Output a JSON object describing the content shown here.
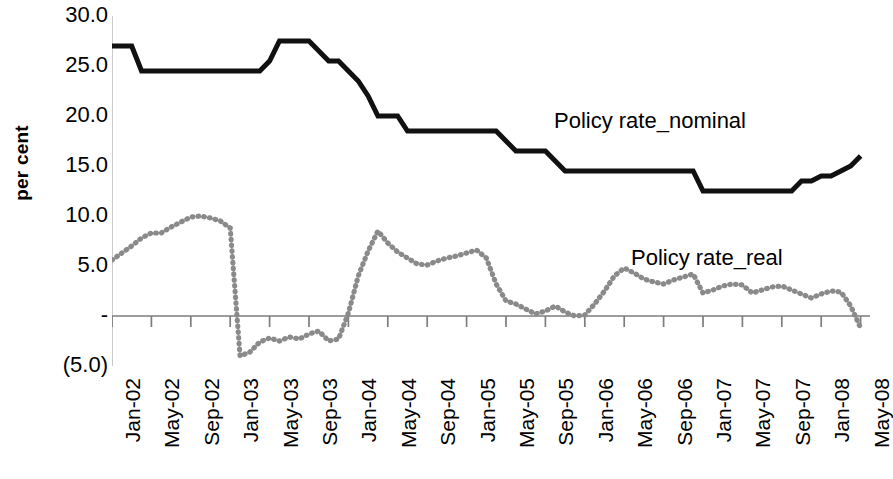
{
  "chart_data": {
    "type": "line",
    "title": "",
    "subtitle": "",
    "xlabel": "",
    "ylabel": "per cent",
    "ylim": [
      -5.0,
      30.0
    ],
    "ytick_values": [
      30.0,
      25.0,
      20.0,
      15.0,
      10.0,
      5.0,
      0.0,
      -5.0
    ],
    "ytick_labels": [
      "30.0",
      "25.0",
      "20.0",
      "15.0",
      "10.0",
      "5.0",
      "-",
      "(5.0)"
    ],
    "grid": false,
    "legend_position": "inline-annotation",
    "x_range": [
      "Jan-02",
      "May-08"
    ],
    "xtick_labels": [
      "Jan-02",
      "May-02",
      "Sep-02",
      "Jan-03",
      "May-03",
      "Sep-03",
      "Jan-04",
      "May-04",
      "Sep-04",
      "Jan-05",
      "May-05",
      "Sep-05",
      "Jan-06",
      "May-06",
      "Sep-06",
      "Jan-07",
      "May-07",
      "Sep-07",
      "Jan-08",
      "May-08"
    ],
    "x_months": [
      "Jan-02",
      "Feb-02",
      "Mar-02",
      "Apr-02",
      "May-02",
      "Jun-02",
      "Jul-02",
      "Aug-02",
      "Sep-02",
      "Oct-02",
      "Nov-02",
      "Dec-02",
      "Jan-03",
      "Feb-03",
      "Mar-03",
      "Apr-03",
      "May-03",
      "Jun-03",
      "Jul-03",
      "Aug-03",
      "Sep-03",
      "Oct-03",
      "Nov-03",
      "Dec-03",
      "Jan-04",
      "Feb-04",
      "Mar-04",
      "Apr-04",
      "May-04",
      "Jun-04",
      "Jul-04",
      "Aug-04",
      "Sep-04",
      "Oct-04",
      "Nov-04",
      "Dec-04",
      "Jan-05",
      "Feb-05",
      "Mar-05",
      "Apr-05",
      "May-05",
      "Jun-05",
      "Jul-05",
      "Aug-05",
      "Sep-05",
      "Oct-05",
      "Nov-05",
      "Dec-05",
      "Jan-06",
      "Feb-06",
      "Mar-06",
      "Apr-06",
      "May-06",
      "Jun-06",
      "Jul-06",
      "Aug-06",
      "Sep-06",
      "Oct-06",
      "Nov-06",
      "Dec-06",
      "Jan-07",
      "Feb-07",
      "Mar-07",
      "Apr-07",
      "May-07",
      "Jun-07",
      "Jul-07",
      "Aug-07",
      "Sep-07",
      "Oct-07",
      "Nov-07",
      "Dec-07",
      "Jan-08",
      "Feb-08",
      "Mar-08",
      "Apr-08",
      "May-08"
    ],
    "series": [
      {
        "name": "Policy rate_nominal",
        "style": "solid-thick-black",
        "color": "#111111",
        "values": [
          27.0,
          27.0,
          27.0,
          24.5,
          24.5,
          24.5,
          24.5,
          24.5,
          24.5,
          24.5,
          24.5,
          24.5,
          24.5,
          24.5,
          24.5,
          24.5,
          25.5,
          27.5,
          27.5,
          27.5,
          27.5,
          26.5,
          25.5,
          25.5,
          24.5,
          23.5,
          22.0,
          20.0,
          20.0,
          20.0,
          18.5,
          18.5,
          18.5,
          18.5,
          18.5,
          18.5,
          18.5,
          18.5,
          18.5,
          18.5,
          17.5,
          16.5,
          16.5,
          16.5,
          16.5,
          15.5,
          14.5,
          14.5,
          14.5,
          14.5,
          14.5,
          14.5,
          14.5,
          14.5,
          14.5,
          14.5,
          14.5,
          14.5,
          14.5,
          14.5,
          12.5,
          12.5,
          12.5,
          12.5,
          12.5,
          12.5,
          12.5,
          12.5,
          12.5,
          12.5,
          13.5,
          13.5,
          14.0,
          14.0,
          14.5,
          15.0,
          16.0
        ]
      },
      {
        "name": "Policy rate_real",
        "style": "dotted-gray",
        "color": "#8a8a8a",
        "values": [
          5.6,
          6.3,
          7.0,
          7.8,
          8.3,
          8.3,
          8.9,
          9.4,
          9.9,
          10.0,
          9.8,
          9.5,
          8.8,
          -4.0,
          -3.6,
          -2.6,
          -2.2,
          -2.5,
          -2.1,
          -2.3,
          -1.8,
          -1.5,
          -2.5,
          -2.3,
          0.3,
          4.0,
          6.5,
          8.5,
          7.3,
          6.4,
          5.8,
          5.2,
          5.1,
          5.5,
          5.8,
          6.0,
          6.3,
          6.6,
          5.8,
          3.2,
          1.5,
          1.2,
          0.7,
          0.2,
          0.5,
          1.0,
          0.4,
          0.0,
          0.1,
          1.2,
          2.5,
          4.0,
          4.8,
          4.3,
          3.7,
          3.4,
          3.2,
          3.6,
          3.9,
          4.2,
          2.3,
          2.6,
          3.0,
          3.2,
          3.1,
          2.3,
          2.6,
          2.9,
          3.0,
          2.6,
          2.2,
          1.8,
          2.2,
          2.5,
          2.4,
          1.0,
          -1.2
        ]
      }
    ]
  },
  "annotations": {
    "nominal_label": "Policy rate_nominal",
    "real_label": "Policy rate_real"
  }
}
